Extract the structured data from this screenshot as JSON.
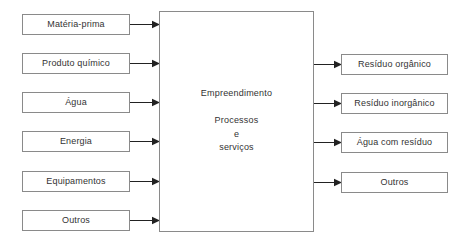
{
  "diagram": {
    "colors": {
      "box_border": "#8a8a8a",
      "text": "#333333",
      "arrow": "#222222",
      "background": "#ffffff"
    },
    "central": {
      "title": "Empreendimento",
      "sub_line_1": "Processos",
      "sub_line_2": "e",
      "sub_line_3": "serviços"
    },
    "inputs": [
      {
        "label": "Matéria-prima"
      },
      {
        "label": "Produto químico"
      },
      {
        "label": "Água"
      },
      {
        "label": "Energia"
      },
      {
        "label": "Equipamentos"
      },
      {
        "label": "Outros"
      }
    ],
    "outputs": [
      {
        "label": "Resíduo orgânico"
      },
      {
        "label": "Resíduo inorgânico"
      },
      {
        "label": "Água com resíduo"
      },
      {
        "label": "Outros"
      }
    ]
  }
}
